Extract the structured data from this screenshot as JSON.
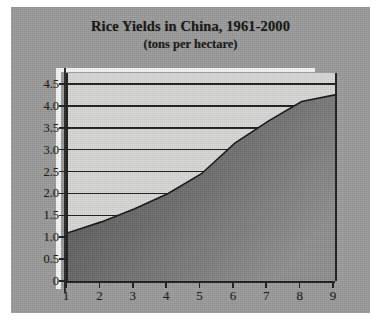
{
  "figure": {
    "title": "Rice Yields in China, 1961-2000",
    "subtitle": "(tons per hectare)"
  },
  "colors": {
    "page_background": "#ffffff",
    "panel_background": "#9a9a9a",
    "plot_background": "#d7d7d4",
    "axis": "#1d1d1d",
    "gridline": "#1e1e1e",
    "area_fill_top": "#6e6e6e",
    "area_fill_bottom": "#4a4a4a",
    "series_line": "#151515",
    "text": "#1c1c1c"
  },
  "chart_data": {
    "type": "area",
    "title": "Rice Yields in China, 1961-2000",
    "subtitle": "(tons per hectare)",
    "xlabel": "",
    "ylabel": "",
    "x": [
      1,
      2,
      3,
      4,
      5,
      6,
      7,
      8,
      9
    ],
    "values": [
      1.1,
      1.35,
      1.65,
      2.0,
      2.45,
      3.15,
      3.65,
      4.1,
      4.25
    ],
    "series": [
      {
        "name": "Rice yield",
        "values": [
          1.1,
          1.35,
          1.65,
          2.0,
          2.45,
          3.15,
          3.65,
          4.1,
          4.25
        ]
      }
    ],
    "xlim": [
      1,
      9
    ],
    "ylim": [
      0,
      4.75
    ],
    "x_tick_labels": [
      "1",
      "2",
      "3",
      "4",
      "5",
      "6",
      "7",
      "8",
      "9"
    ],
    "y_tick_labels": [
      "0",
      "0.5",
      "1.0",
      "1.5",
      "2.0",
      "2.5",
      "3.0",
      "3.5",
      "4.0",
      "4.5"
    ],
    "y_tick_values": [
      0,
      0.5,
      1.0,
      1.5,
      2.0,
      2.5,
      3.0,
      3.5,
      4.0,
      4.5
    ],
    "gridlines": "horizontal",
    "legend": "none"
  }
}
